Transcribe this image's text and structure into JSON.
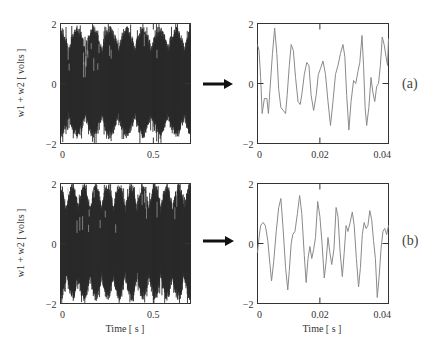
{
  "chart_data": [
    {
      "id": "a-full",
      "type": "line",
      "row": "a",
      "xlabel": "",
      "ylabel": "w1 + w2  [ volts ]",
      "xlim": [
        0,
        0.7
      ],
      "ylim": [
        -2,
        2
      ],
      "xticks": [
        0,
        0.5
      ],
      "xtick_labels": [
        "0",
        "0.5"
      ],
      "yticks": [
        -2,
        0,
        2
      ],
      "ytick_labels": [
        "−2",
        "0",
        "2"
      ],
      "grid": false,
      "style": "dense",
      "description": "Dense high-frequency signal, envelope approx ±1.8 V, periodic beating peaks",
      "seed": 3,
      "f1": 205,
      "f2": 230,
      "a1": 1.0,
      "a2": 0.75
    },
    {
      "id": "a-zoom",
      "type": "line",
      "row": "a",
      "xlabel": "",
      "ylabel": "",
      "xlim": [
        0,
        0.042
      ],
      "ylim": [
        -2,
        2
      ],
      "xticks": [
        0,
        0.02,
        0.04
      ],
      "xtick_labels": [
        "0",
        "0.02",
        "0.04"
      ],
      "yticks": [
        -2,
        0,
        2
      ],
      "ytick_labels": [
        "−2",
        "0",
        "2"
      ],
      "grid": false,
      "style": "thin",
      "x": [
        0,
        0.0005,
        0.001,
        0.0015,
        0.0022,
        0.003,
        0.0035,
        0.004,
        0.0048,
        0.0055,
        0.0062,
        0.0068,
        0.0075,
        0.0083,
        0.009,
        0.0095,
        0.0102,
        0.0108,
        0.0115,
        0.0122,
        0.013,
        0.0137,
        0.0143,
        0.015,
        0.0158,
        0.0165,
        0.0172,
        0.018,
        0.0188,
        0.0195,
        0.0202,
        0.021,
        0.0218,
        0.0226,
        0.0234,
        0.0242,
        0.025,
        0.0258,
        0.0266,
        0.0274,
        0.028,
        0.0286,
        0.0293,
        0.03,
        0.0308,
        0.0315,
        0.0322,
        0.0328,
        0.0335,
        0.034,
        0.0345,
        0.035,
        0.0357,
        0.0364,
        0.037,
        0.0376,
        0.0382,
        0.0388,
        0.0394,
        0.04,
        0.0406,
        0.0412,
        0.0417,
        0.042
      ],
      "values": [
        1.3,
        1.1,
        0.2,
        -1.0,
        -0.5,
        -0.5,
        -1.0,
        -0.2,
        1.0,
        1.85,
        1.0,
        -0.2,
        -0.8,
        -0.9,
        -1.0,
        -0.4,
        0.6,
        1.3,
        1.1,
        0.2,
        -0.6,
        -0.7,
        -0.3,
        0.3,
        0.7,
        0.6,
        -0.4,
        -0.9,
        -0.4,
        0.3,
        0.5,
        0.75,
        0.3,
        -0.6,
        -1.4,
        -0.6,
        0.3,
        0.6,
        1.0,
        1.3,
        0.9,
        -0.4,
        -1.55,
        -0.6,
        0.1,
        0.0,
        0.4,
        0.7,
        1.6,
        0.6,
        -0.8,
        -1.4,
        -0.8,
        0.2,
        -0.3,
        -0.6,
        -0.1,
        0.0,
        0.6,
        1.55,
        1.3,
        0.9,
        0.6,
        1.5
      ]
    },
    {
      "id": "b-full",
      "type": "line",
      "row": "b",
      "xlabel": "Time  [ s ]",
      "ylabel": "w1 + w2  [ volts ]",
      "xlim": [
        0,
        0.7
      ],
      "ylim": [
        -2,
        2
      ],
      "xticks": [
        0,
        0.5
      ],
      "xtick_labels": [
        "0",
        "0.5"
      ],
      "yticks": [
        -2,
        0,
        2
      ],
      "ytick_labels": [
        "−2",
        "0",
        "2"
      ],
      "grid": false,
      "style": "dense",
      "description": "Dense high-frequency signal, envelope approx ±2 V, more irregular spikes",
      "seed": 11,
      "f1": 205,
      "f2": 240,
      "a1": 1.0,
      "a2": 0.85
    },
    {
      "id": "b-zoom",
      "type": "line",
      "row": "b",
      "xlabel": "Time  [ s ]",
      "ylabel": "",
      "xlim": [
        0,
        0.042
      ],
      "ylim": [
        -2,
        2
      ],
      "xticks": [
        0,
        0.02,
        0.04
      ],
      "xtick_labels": [
        "0",
        "0.02",
        "0.04"
      ],
      "yticks": [
        -2,
        0,
        2
      ],
      "ytick_labels": [
        "−2",
        "0",
        "2"
      ],
      "grid": false,
      "style": "thin",
      "x": [
        0,
        0.0005,
        0.001,
        0.0018,
        0.0025,
        0.0033,
        0.004,
        0.0045,
        0.0052,
        0.006,
        0.0068,
        0.0075,
        0.0082,
        0.009,
        0.0097,
        0.0102,
        0.0108,
        0.0113,
        0.012,
        0.0128,
        0.0135,
        0.0142,
        0.015,
        0.0156,
        0.0162,
        0.0168,
        0.0174,
        0.018,
        0.0186,
        0.0193,
        0.02,
        0.0207,
        0.0214,
        0.022,
        0.0226,
        0.0232,
        0.0238,
        0.0245,
        0.0252,
        0.0258,
        0.0265,
        0.0272,
        0.0278,
        0.0284,
        0.029,
        0.0297,
        0.0304,
        0.031,
        0.0317,
        0.0324,
        0.033,
        0.0336,
        0.0342,
        0.0348,
        0.0354,
        0.036,
        0.0366,
        0.0372,
        0.0378,
        0.0384,
        0.039,
        0.0396,
        0.0402,
        0.0408,
        0.0414,
        0.042
      ],
      "values": [
        -0.3,
        0.2,
        0.6,
        0.7,
        0.6,
        0.1,
        -0.7,
        -1.25,
        -0.6,
        0.4,
        1.2,
        1.5,
        0.5,
        -0.8,
        -1.55,
        -0.9,
        0.0,
        0.3,
        0.4,
        1.0,
        1.6,
        1.0,
        -0.4,
        -1.3,
        -0.5,
        -0.1,
        -0.5,
        -0.2,
        0.2,
        1.4,
        0.9,
        0.0,
        -1.15,
        -0.6,
        0.2,
        -0.3,
        -0.7,
        -0.2,
        1.2,
        0.9,
        -0.3,
        -1.1,
        -0.3,
        0.6,
        0.4,
        0.7,
        1.05,
        0.6,
        -0.5,
        -1.45,
        -0.8,
        0.3,
        0.7,
        0.5,
        0.6,
        1.1,
        0.8,
        0.1,
        -0.5,
        -1.8,
        -1.1,
        -0.2,
        0.4,
        0.5,
        0.3,
        0.6
      ]
    }
  ],
  "labels": {
    "row_a": "(a)",
    "row_b": "(b)",
    "ylabel_a": "w1 + w2  [ volts ]",
    "ylabel_b": "w1 + w2  [ volts ]",
    "xlabel_b_left": "Time  [ s ]",
    "xlabel_b_right": "Time  [ s ]"
  },
  "colors": {
    "dense_trace": "#2a2a2a",
    "thin_trace": "#8a8a8a",
    "frame": "#333333",
    "arrow": "#111111"
  },
  "icons": {
    "arrow_a": "right-arrow-icon",
    "arrow_b": "right-arrow-icon"
  }
}
